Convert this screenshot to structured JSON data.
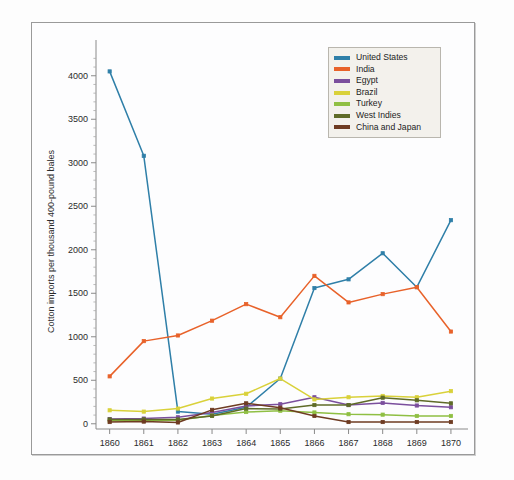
{
  "chart_data": {
    "type": "line",
    "title": "",
    "xlabel": "",
    "ylabel": "Cotton imports per thousand 400-pound bales",
    "x": [
      1860,
      1861,
      1862,
      1863,
      1864,
      1865,
      1866,
      1867,
      1868,
      1869,
      1870
    ],
    "xticklabels": [
      "1860",
      "1861",
      "1862",
      "1863",
      "1864",
      "1865",
      "1866",
      "1867",
      "1868",
      "1869",
      "1870"
    ],
    "yticks": [
      0,
      500,
      1000,
      1500,
      2000,
      2500,
      3000,
      3500,
      4000
    ],
    "yticklabels": [
      "0",
      "500",
      "1000",
      "1500",
      "2000",
      "2500",
      "3000",
      "3500",
      "4000"
    ],
    "ylim": [
      -60,
      4250
    ],
    "xlim": [
      1859.6,
      1870.5
    ],
    "grid": false,
    "legend_position": "top-right",
    "series": [
      {
        "name": "United States",
        "color": "#2f7fa8",
        "values": [
          4050,
          3080,
          140,
          110,
          190,
          520,
          1560,
          1660,
          1960,
          1570,
          2340
        ]
      },
      {
        "name": "India",
        "color": "#e8622a",
        "values": [
          545,
          950,
          1015,
          1185,
          1375,
          1225,
          1700,
          1395,
          1490,
          1570,
          1060
        ]
      },
      {
        "name": "Egypt",
        "color": "#7b4f9d",
        "values": [
          55,
          60,
          75,
          130,
          205,
          225,
          305,
          215,
          240,
          210,
          190
        ]
      },
      {
        "name": "Brazil",
        "color": "#d9d13a",
        "values": [
          155,
          140,
          175,
          290,
          345,
          520,
          280,
          305,
          320,
          305,
          375
        ]
      },
      {
        "name": "Turkey",
        "color": "#8fbf43",
        "values": [
          35,
          35,
          40,
          95,
          135,
          150,
          130,
          110,
          105,
          90,
          90
        ]
      },
      {
        "name": "West Indies",
        "color": "#5f6b28",
        "values": [
          50,
          50,
          50,
          90,
          175,
          170,
          215,
          215,
          300,
          270,
          235
        ]
      },
      {
        "name": "China and Japan",
        "color": "#6e3b22",
        "values": [
          20,
          25,
          15,
          160,
          235,
          185,
          90,
          20,
          20,
          20,
          20
        ]
      }
    ]
  },
  "legend": {
    "items": [
      {
        "label": "United States"
      },
      {
        "label": "India"
      },
      {
        "label": "Egypt"
      },
      {
        "label": "Brazil"
      },
      {
        "label": "Turkey"
      },
      {
        "label": "West Indies"
      },
      {
        "label": "China and Japan"
      }
    ]
  }
}
